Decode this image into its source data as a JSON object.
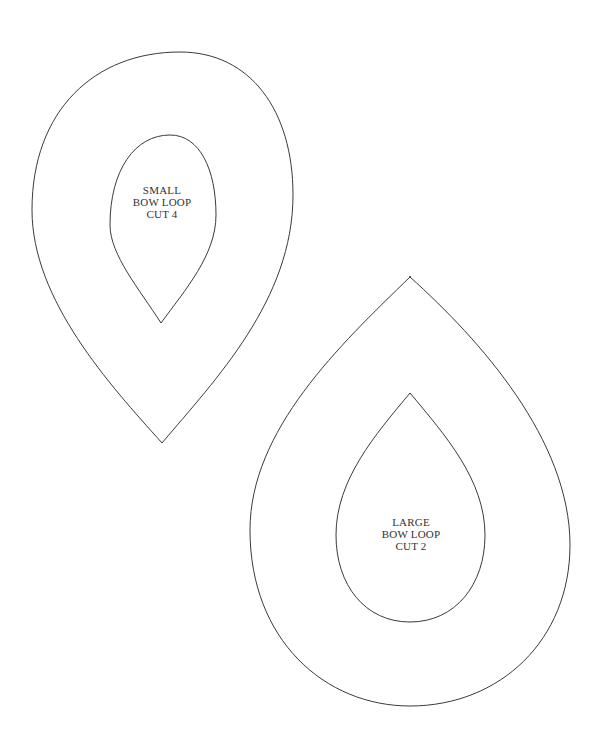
{
  "colors": {
    "background": "#ffffff",
    "stroke": "#3a3a3a",
    "text": "#333333"
  },
  "pieces": [
    {
      "name": "small-bow-loop",
      "label_lines": [
        "SMALL",
        "BOW LOOP",
        "CUT 4"
      ]
    },
    {
      "name": "large-bow-loop",
      "label_lines": [
        "LARGE",
        "BOW LOOP",
        "CUT 2"
      ]
    }
  ]
}
